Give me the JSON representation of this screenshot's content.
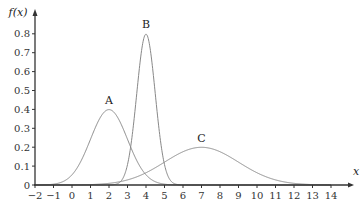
{
  "chart_data": {
    "type": "line",
    "title": "",
    "xlabel": "x",
    "ylabel": "f(x)",
    "xlim": [
      -2,
      14
    ],
    "ylim": [
      0,
      0.85
    ],
    "x_ticks": [
      "−2",
      "−1",
      "0",
      "1",
      "2",
      "3",
      "4",
      "5",
      "6",
      "7",
      "8",
      "9",
      "10",
      "11",
      "12",
      "13",
      "14"
    ],
    "y_ticks": [
      "0",
      "0.1",
      "0.2",
      "0.3",
      "0.4",
      "0.5",
      "0.6",
      "0.7",
      "0.8"
    ],
    "grid": false,
    "legend": "none",
    "series": [
      {
        "name": "A",
        "distribution": "normal",
        "mean": 2,
        "sd": 1,
        "peak": 0.4,
        "label_x": 2,
        "label_y": 0.43
      },
      {
        "name": "B",
        "distribution": "normal",
        "mean": 4,
        "sd": 0.5,
        "peak": 0.8,
        "label_x": 4,
        "label_y": 0.83
      },
      {
        "name": "C",
        "distribution": "normal",
        "mean": 7,
        "sd": 2,
        "peak": 0.2,
        "label_x": 7,
        "label_y": 0.23
      }
    ],
    "colors": {
      "curve": "#888888",
      "axis": "#333333"
    }
  }
}
